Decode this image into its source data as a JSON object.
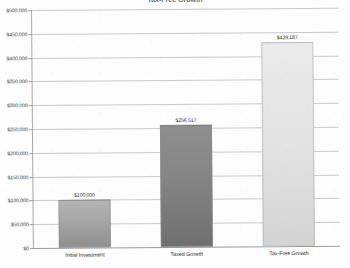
{
  "chart_data": {
    "type": "bar",
    "title": "",
    "xlabel": "",
    "ylabel": "",
    "ylim": [
      0,
      500000
    ],
    "grid": true,
    "legend": "none",
    "categories": [
      "Initial Investment",
      "Taxed Growth",
      "Tax-Free Growth"
    ],
    "values": [
      100000,
      256517,
      429187
    ],
    "data_labels": [
      "$100,000",
      "$256,517",
      "$429,187"
    ],
    "ytick_values": [
      0,
      50000,
      100000,
      150000,
      200000,
      250000,
      300000,
      350000,
      400000,
      450000,
      500000
    ],
    "ytick_labels": [
      "$0",
      "$50,000",
      "$100,000",
      "$150,000",
      "$200,000",
      "$250,000",
      "$300,000",
      "$350,000",
      "$400,000",
      "$450,000",
      "$500,000"
    ],
    "bar_colors": [
      "#a9a9a9",
      "#868686",
      "#e4e4e4"
    ],
    "gridline_color": "#c9c9c9",
    "axis_color": "#9a9a9a",
    "text_color": "#2f2f2f"
  },
  "title_sliver": {
    "text": "Tax-Free Growth"
  }
}
